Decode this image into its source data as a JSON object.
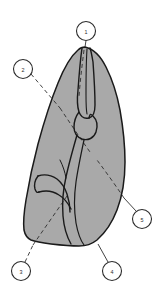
{
  "figure": {
    "background_color": "#ffffff",
    "specimen": {
      "name": "specimen-body",
      "fill_color": "#a9a9a9",
      "stroke_color": "#1a1a1a",
      "description": "Elongated pear/leaf-shaped body with pointed apex at top and broad rounded base at bottom"
    },
    "internal_features": [
      {
        "name": "central-ridge-structure",
        "description": "Narrow elongated vertical structure running from apex downward with a joint-like constriction near the middle",
        "stroke_color": "#1a1a1a"
      },
      {
        "name": "branching-groove",
        "description": "Y-shaped branching groove in the lower left region",
        "stroke_color": "#1a1a1a"
      },
      {
        "name": "long-medial-furrow",
        "description": "Long curving furrow running from the central joint down to the basal margin",
        "stroke_color": "#1a1a1a"
      }
    ],
    "leader_line_style": {
      "name": "dashed-leader",
      "stroke_color": "#3a3a3a",
      "dash_pattern": "4 3"
    },
    "callouts": [
      {
        "id": "callout-1",
        "label": "1",
        "position": "top-center",
        "circle": {
          "cx": 86,
          "cy": 31,
          "r": 9.5
        },
        "leader": {
          "x1": 86,
          "y1": 40.5,
          "x2": 85,
          "y2": 47
        },
        "leader_style": "solid"
      },
      {
        "id": "callout-2",
        "label": "2",
        "position": "upper-left",
        "circle": {
          "cx": 23,
          "cy": 69,
          "r": 9.5
        },
        "leader": {
          "x1": 31,
          "y1": 74,
          "x2": 60,
          "y2": 108
        },
        "leader_style": "dashed"
      },
      {
        "id": "callout-3",
        "label": "3",
        "position": "bottom-left",
        "circle": {
          "cx": 21,
          "cy": 271,
          "r": 9.5
        },
        "leader": {
          "x1": 25,
          "y1": 262,
          "x2": 33,
          "y2": 245
        },
        "leader_style": "dashed"
      },
      {
        "id": "callout-4",
        "label": "4",
        "position": "bottom-right",
        "circle": {
          "cx": 112,
          "cy": 271,
          "r": 9.5
        },
        "leader": {
          "x1": 108,
          "y1": 262,
          "x2": 98,
          "y2": 244
        },
        "leader_style": "solid"
      },
      {
        "id": "callout-5",
        "label": "5",
        "position": "right",
        "circle": {
          "cx": 142,
          "cy": 219,
          "r": 9.5
        },
        "leader": {
          "x1": 136,
          "y1": 211,
          "x2": 124,
          "y2": 198
        },
        "leader_style": "solid"
      }
    ],
    "internal_dashed_lines": [
      {
        "name": "dashed-line-upper-left",
        "description": "Dashed reference line continuing from callout 2 across the upper body"
      },
      {
        "name": "dashed-line-lower-left",
        "description": "Dashed reference line running to the lower left margin toward callout 3"
      },
      {
        "name": "dashed-line-right",
        "description": "Dashed reference line running diagonally down the right side toward callout 5"
      },
      {
        "name": "dashed-line-apex",
        "description": "Dashed reference line running down the middle from the apex"
      }
    ]
  }
}
